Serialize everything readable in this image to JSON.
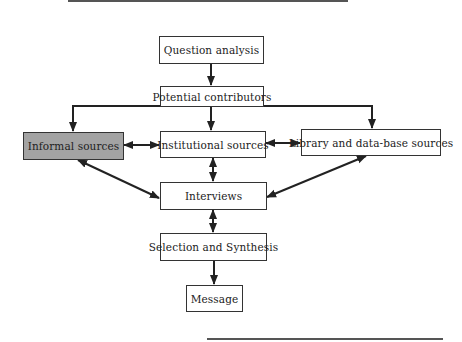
{
  "diagram": {
    "nodes": {
      "question_analysis": {
        "label": "Question analysis"
      },
      "potential_contributors": {
        "label": "Potential contributors"
      },
      "informal_sources": {
        "label": "Informal sources",
        "fill": "#a3a3a3"
      },
      "institutional_sources": {
        "label": "Institutional sources"
      },
      "library_sources": {
        "label": "Library and data-base sources"
      },
      "interviews": {
        "label": "Interviews"
      },
      "selection_synthesis": {
        "label": "Selection and Synthesis"
      },
      "message": {
        "label": "Message"
      }
    },
    "edges": [
      {
        "from": "Question analysis",
        "to": "Potential contributors",
        "type": "arrow"
      },
      {
        "from": "Potential contributors",
        "to": "Informal sources",
        "type": "arrow"
      },
      {
        "from": "Potential contributors",
        "to": "Institutional sources",
        "type": "arrow"
      },
      {
        "from": "Potential contributors",
        "to": "Library and data-base sources",
        "type": "arrow"
      },
      {
        "from": "Informal sources",
        "to": "Institutional sources",
        "type": "bidirectional"
      },
      {
        "from": "Institutional sources",
        "to": "Library and data-base sources",
        "type": "bidirectional"
      },
      {
        "from": "Informal sources",
        "to": "Interviews",
        "type": "bidirectional"
      },
      {
        "from": "Institutional sources",
        "to": "Interviews",
        "type": "bidirectional"
      },
      {
        "from": "Library and data-base sources",
        "to": "Interviews",
        "type": "bidirectional"
      },
      {
        "from": "Interviews",
        "to": "Selection and Synthesis",
        "type": "bidirectional"
      },
      {
        "from": "Selection and Synthesis",
        "to": "Message",
        "type": "arrow"
      }
    ]
  }
}
